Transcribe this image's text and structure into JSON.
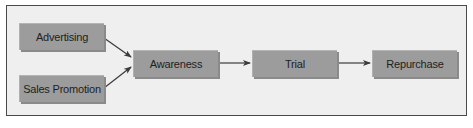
{
  "diagram": {
    "nodes": [
      {
        "id": "advertising",
        "label": "Advertising"
      },
      {
        "id": "sales_promotion",
        "label": "Sales Promotion"
      },
      {
        "id": "awareness",
        "label": "Awareness"
      },
      {
        "id": "trial",
        "label": "Trial"
      },
      {
        "id": "repurchase",
        "label": "Repurchase"
      }
    ],
    "edges": [
      {
        "from": "advertising",
        "to": "awareness"
      },
      {
        "from": "sales_promotion",
        "to": "awareness"
      },
      {
        "from": "awareness",
        "to": "trial"
      },
      {
        "from": "trial",
        "to": "repurchase"
      }
    ],
    "colors": {
      "background": "#efefef",
      "frame_border": "#4a4a4a",
      "box_fill": "#9c9c9c",
      "arrow": "#3a3a3a",
      "text": "#1e1e1e"
    }
  }
}
